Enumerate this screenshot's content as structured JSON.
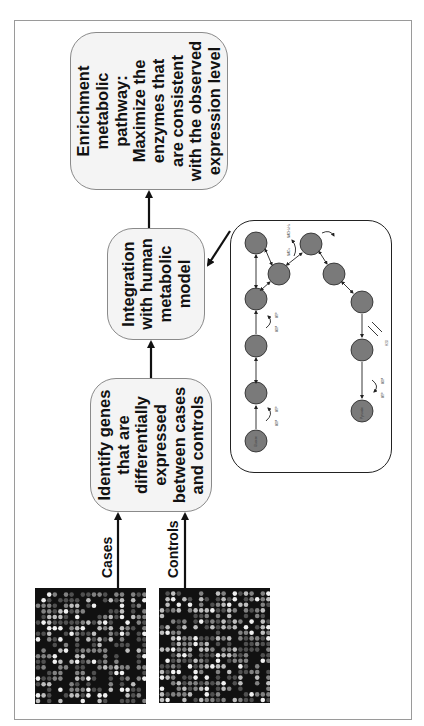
{
  "diagram": {
    "orientation": "rotated-90-ccw",
    "inputs": {
      "cases_label": "Cases",
      "controls_label": "Controls",
      "heatmap_cases": "microarray-heatmap",
      "heatmap_controls": "microarray-heatmap"
    },
    "steps": {
      "identify": {
        "lines": [
          "Identify genes",
          "that are",
          "differentially",
          "expressed",
          "between cases",
          "and controls"
        ]
      },
      "integration": {
        "lines": [
          "Integration",
          "with human",
          "metabolic",
          "model"
        ]
      },
      "enrichment": {
        "lines": [
          "Enrichment",
          "metabolic",
          "pathway:",
          "Maximize the",
          "enzymes that",
          "are consistent",
          "with the observed",
          "expression level"
        ]
      }
    },
    "pathway_panel": {
      "start_node": "Glucose",
      "end_node": "Pyruvate",
      "cofactors": [
        "ADP",
        "ATP",
        "NAD+",
        "NADH+H+",
        "H2O"
      ],
      "node_count": 10
    },
    "colors": {
      "box_fill": "#f4f4f4",
      "box_border": "#8a8a8a",
      "node_fill": "#7a7a7a",
      "arrow": "#111111",
      "frame": "#9a9a9a"
    }
  }
}
